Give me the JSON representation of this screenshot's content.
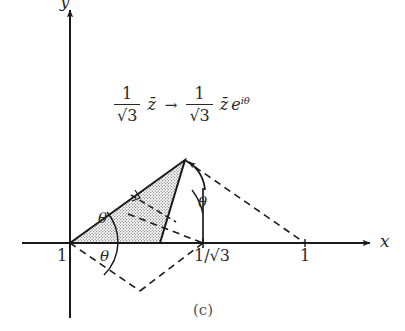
{
  "figure": {
    "caption": "(c)",
    "axes": {
      "x_label": "x",
      "y_label": "y",
      "x_axis_name": "x-axis",
      "y_axis_name": "y-axis"
    },
    "tick_labels": {
      "origin_one": "1",
      "right_one": "1",
      "inv_sqrt3": "1/√3"
    },
    "angle_labels": {
      "upper": "θ",
      "lower": "θ",
      "apex": "θ"
    },
    "formula": {
      "left_numerator": "1",
      "left_denominator": "√3",
      "left_variable": "z̄",
      "arrow": "→",
      "right_numerator": "1",
      "right_denominator": "√3",
      "right_variable": "z̄",
      "exponential_base": "e",
      "exponential_exponent": "iθ",
      "full_text": "(1/√3) z̄ → (1/√3) z̄ e^{iθ}"
    },
    "colors": {
      "ink": "#1a1a1a",
      "line": "#2a2a2a",
      "fill_stipple": "#b9b9b9",
      "background": "#ffffff",
      "caption_gray": "#555555"
    },
    "geometry": {
      "origin": [
        70,
        243
      ],
      "apex": [
        185,
        160
      ],
      "inv_sqrt3_point": [
        203,
        243
      ],
      "right_one_point": [
        305,
        243
      ],
      "triangle_base_right": [
        160,
        243
      ],
      "lower_dashed_vertex": [
        140,
        291
      ],
      "shaded_triangle": [
        [
          70,
          243
        ],
        [
          185,
          160
        ],
        [
          160,
          243
        ]
      ]
    }
  }
}
